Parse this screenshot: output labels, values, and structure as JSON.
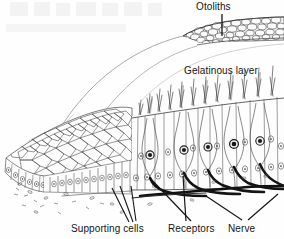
{
  "figure": {
    "caption_labels": [
      "Otoliths",
      "Gelatinous layer",
      "Supporting cells",
      "Receptors",
      "Nerve"
    ]
  },
  "labels": {
    "otoliths": "Otoliths",
    "gelatinous_layer": "Gelatinous layer",
    "supporting_cells": "Supporting cells",
    "receptors": "Receptors",
    "nerve": "Nerve"
  },
  "colors": {
    "background": "#ffffff",
    "ink": "#141414",
    "line": "#3a3a3a",
    "light_line": "#8d8d8d",
    "faint_line": "#b9b9b9",
    "nerve_dark": "#111111",
    "otolith_fill": "#f2f2f2"
  },
  "structures": [
    {
      "name": "otolith-layer",
      "description": "granular band of calcium carbonate crystals along the top right edge"
    },
    {
      "name": "gelatinous-layer",
      "description": "domed transparent cupula sweeping from upper right down to lower left"
    },
    {
      "name": "hair-bundles",
      "description": "stereocilia tufts projecting upward from receptor cells into the gelatinous layer"
    },
    {
      "name": "polygonal-epithelium",
      "description": "surface view mosaic of supporting cell outlines at left"
    },
    {
      "name": "columnar-cells",
      "description": "tall supporting cells with oval nuclei in sectioned view"
    },
    {
      "name": "receptor-cells",
      "description": "flask shaped hair cells with large dark nuclei"
    },
    {
      "name": "nerve-trunk",
      "description": "thick dark nerve fibres running horizontally with branches ascending to receptors"
    },
    {
      "name": "connective-tissue",
      "description": "sparse scattered cells below the basement membrane"
    }
  ]
}
